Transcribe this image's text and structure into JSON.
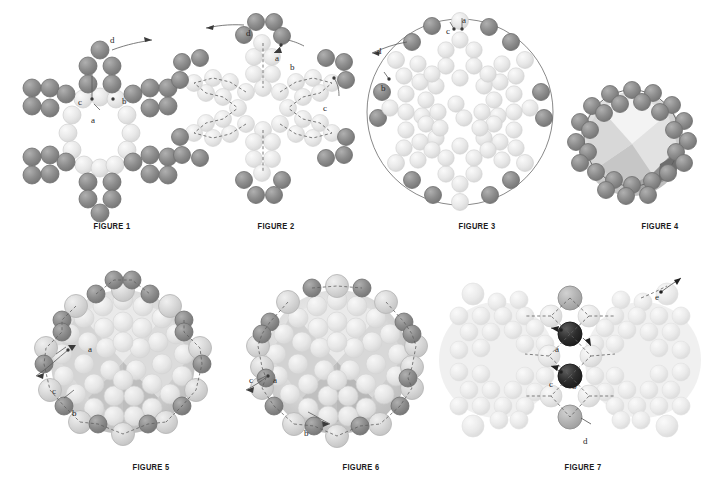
{
  "page": {
    "background_color": "#ffffff",
    "width": 706,
    "height": 492
  },
  "palette": {
    "bead_dark": "#8d8d8d",
    "bead_dark_edge": "#6f6f6f",
    "bead_mid": "#b4b4b4",
    "bead_light": "#d8d8d8",
    "bead_light_edge": "#c0c0c0",
    "bead_pale": "#e6e6e6",
    "bead_black": "#2e2e2e",
    "thread": "#5a5a5a",
    "caption_text": "#1b1b1b",
    "label_text": "#262626"
  },
  "figures": [
    {
      "id": "figure-1",
      "caption": "FIGURE 1",
      "description": "Six-pointed star ring of beads with one point completed",
      "labels": [
        {
          "letter": "d",
          "x": 110,
          "y": 36
        },
        {
          "letter": "c",
          "x": 78,
          "y": 98
        },
        {
          "letter": "a",
          "x": 91,
          "y": 116
        },
        {
          "letter": "b",
          "x": 122,
          "y": 97
        }
      ]
    },
    {
      "id": "figure-2",
      "caption": "FIGURE 2",
      "description": "Star ring with thread path and dark corner bead clusters added at each point",
      "labels": [
        {
          "letter": "d",
          "x": 246,
          "y": 29
        },
        {
          "letter": "a",
          "x": 275,
          "y": 54
        },
        {
          "letter": "b",
          "x": 290,
          "y": 63
        },
        {
          "letter": "c",
          "x": 323,
          "y": 104
        }
      ]
    },
    {
      "id": "figure-3",
      "caption": "FIGURE 3",
      "description": "Flattened circular net of beads with outer ring of dark beads",
      "labels": [
        {
          "letter": "a",
          "x": 462,
          "y": 16
        },
        {
          "letter": "c",
          "x": 446,
          "y": 27
        },
        {
          "letter": "d",
          "x": 377,
          "y": 47
        },
        {
          "letter": "b",
          "x": 381,
          "y": 84
        }
      ]
    },
    {
      "id": "figure-4",
      "caption": "FIGURE 4",
      "description": "Beaded ball beginning to cup into a sphere, outer ring of dark beads",
      "labels": []
    },
    {
      "id": "figure-5",
      "caption": "FIGURE 5",
      "description": "Beaded ball with equatorial band of dark and light accent beads",
      "labels": [
        {
          "letter": "a",
          "x": 88,
          "y": 345
        },
        {
          "letter": "c",
          "x": 52,
          "y": 387
        },
        {
          "letter": "b",
          "x": 72,
          "y": 409
        }
      ]
    },
    {
      "id": "figure-6",
      "caption": "FIGURE 6",
      "description": "Beaded ball with alternating accent beads added around the equator",
      "labels": [
        {
          "letter": "c",
          "x": 249,
          "y": 376
        },
        {
          "letter": "a",
          "x": 273,
          "y": 376
        },
        {
          "letter": "b",
          "x": 304,
          "y": 429
        }
      ]
    },
    {
      "id": "figure-7",
      "caption": "FIGURE 7",
      "description": "Two beaded balls joined by a connector column of dark beads",
      "labels": [
        {
          "letter": "e",
          "x": 655,
          "y": 293
        },
        {
          "letter": "a",
          "x": 555,
          "y": 345
        },
        {
          "letter": "b",
          "x": 572,
          "y": 382
        },
        {
          "letter": "c",
          "x": 549,
          "y": 380
        },
        {
          "letter": "d",
          "x": 583,
          "y": 437
        }
      ]
    }
  ],
  "captions": [
    {
      "text": "FIGURE 1",
      "x": 91,
      "y": 221
    },
    {
      "text": "FIGURE 2",
      "x": 255,
      "y": 221
    },
    {
      "text": "FIGURE 3",
      "x": 456,
      "y": 221
    },
    {
      "text": "FIGURE 4",
      "x": 639,
      "y": 221
    },
    {
      "text": "FIGURE 5",
      "x": 130,
      "y": 462
    },
    {
      "text": "FIGURE 6",
      "x": 340,
      "y": 462
    },
    {
      "text": "FIGURE 7",
      "x": 562,
      "y": 462
    }
  ]
}
